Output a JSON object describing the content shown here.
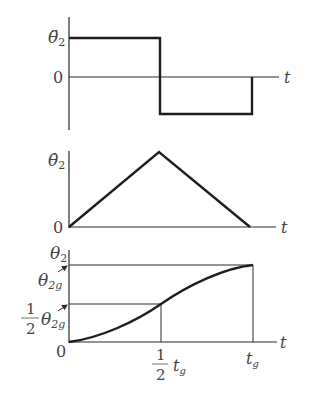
{
  "panels": [
    {
      "id": "acceleration",
      "y_label": "θ̈",
      "y_label_sub": "2",
      "zero_label": "0",
      "x_label": "t",
      "description": "Angular acceleration: constant positive for first half, constant negative for second half"
    },
    {
      "id": "velocity",
      "y_label": "θ̇",
      "y_label_sub": "2",
      "zero_label": "0",
      "x_label": "t",
      "description": "Angular velocity: linear rise to peak at half time, linear fall to zero at t_g"
    },
    {
      "id": "position",
      "y_label": "θ",
      "y_label_sub": "2",
      "zero_label": "0",
      "x_label": "t",
      "level_full": {
        "symbol": "θ",
        "sub": "2g"
      },
      "level_half": {
        "frac_num": "1",
        "frac_den": "2",
        "symbol": "θ",
        "sub": "2g"
      },
      "tick_half": {
        "frac_num": "1",
        "frac_den": "2",
        "symbol": "t",
        "sub": "g"
      },
      "tick_full": {
        "symbol": "t",
        "sub": "g"
      },
      "description": "Angular position: S-curve from 0 to θ2g, passing ½θ2g at ½t_g"
    }
  ],
  "colors": {
    "ink": "#1e1e1e",
    "label": "#444444",
    "background": "#ffffff"
  }
}
